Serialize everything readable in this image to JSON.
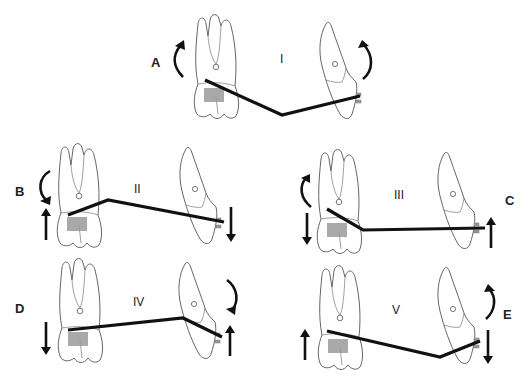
{
  "figure": {
    "panels": [
      {
        "id": "I",
        "label": "I",
        "letter": "A",
        "molar_moment": "counterclockwise",
        "canine_moment": "clockwise",
        "molar_force": "none",
        "canine_force": "none"
      },
      {
        "id": "II",
        "label": "II",
        "letter": "B",
        "molar_moment": "clockwise",
        "canine_moment": "none",
        "molar_force": "up",
        "canine_force": "down"
      },
      {
        "id": "III",
        "label": "III",
        "letter": "C",
        "molar_moment": "counterclockwise",
        "canine_moment": "none",
        "molar_force": "down",
        "canine_force": "up"
      },
      {
        "id": "IV",
        "label": "IV",
        "letter": "D",
        "molar_moment": "none",
        "canine_moment": "clockwise",
        "molar_force": "down",
        "canine_force": "up"
      },
      {
        "id": "V",
        "label": "V",
        "letter": "E",
        "molar_moment": "none",
        "canine_moment": "counterclockwise",
        "molar_force": "up",
        "canine_force": "down"
      }
    ]
  },
  "colors": {
    "wire": "#111111",
    "tooth_outline": "#555555",
    "molar_tube": "#999999",
    "arrow": "#111111"
  }
}
